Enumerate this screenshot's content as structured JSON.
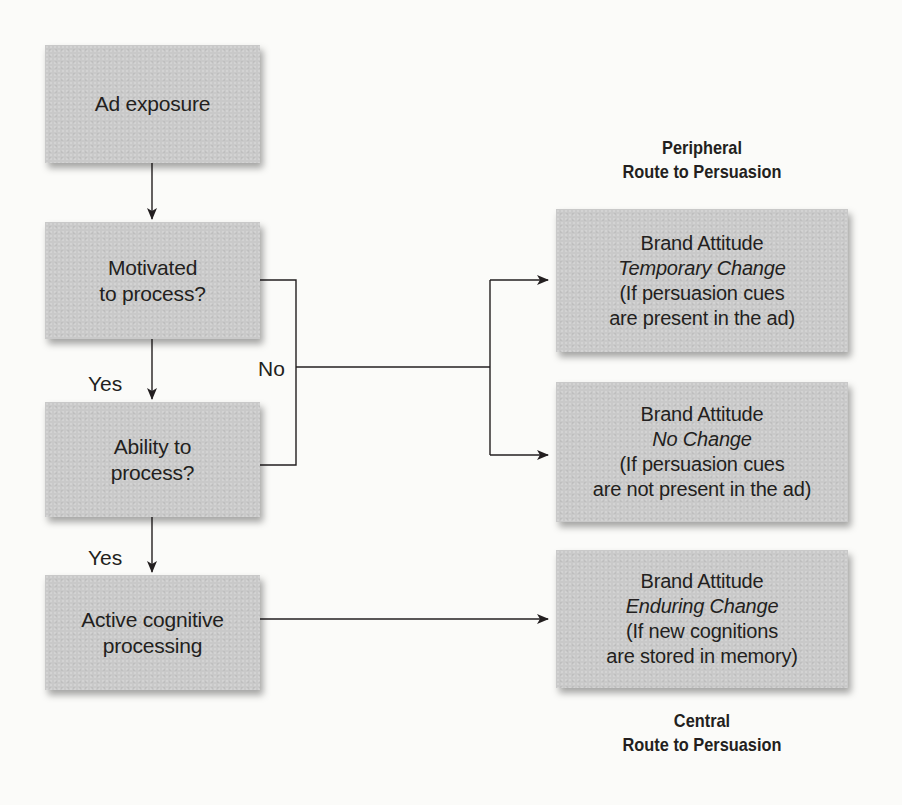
{
  "diagram": {
    "type": "flowchart",
    "colors": {
      "box_fill": "#c9c9c9",
      "line": "#231f20",
      "background": "#fbfbf9",
      "text": "#231f20"
    },
    "left_column": {
      "ad_exposure": {
        "lines": [
          "Ad exposure"
        ]
      },
      "motivated": {
        "lines": [
          "Motivated",
          "to process?"
        ]
      },
      "ability": {
        "lines": [
          "Ability to",
          "process?"
        ]
      },
      "active": {
        "lines": [
          "Active cognitive",
          "processing"
        ]
      }
    },
    "edge_labels": {
      "yes_1": "Yes",
      "yes_2": "Yes",
      "no": "No"
    },
    "right_column": {
      "peripheral_title": [
        "Peripheral",
        "Route to Persuasion"
      ],
      "temporary": {
        "heading": "Brand Attitude",
        "change": "Temporary Change",
        "condition": [
          "(If persuasion cues",
          "are present in the ad)"
        ]
      },
      "no_change": {
        "heading": "Brand Attitude",
        "change": "No Change",
        "condition": [
          "(If persuasion cues",
          "are not present in the ad)"
        ]
      },
      "enduring": {
        "heading": "Brand Attitude",
        "change": "Enduring Change",
        "condition": [
          "(If new cognitions",
          "are stored in memory)"
        ]
      },
      "central_title": [
        "Central",
        "Route to Persuasion"
      ]
    },
    "edges": [
      {
        "from": "Ad exposure",
        "to": "Motivated to process?",
        "label": ""
      },
      {
        "from": "Motivated to process?",
        "to": "Ability to process?",
        "label": "Yes"
      },
      {
        "from": "Ability to process?",
        "to": "Active cognitive processing",
        "label": "Yes"
      },
      {
        "from": "Motivated to process?",
        "to": "Brand Attitude Temporary Change",
        "label": "No"
      },
      {
        "from": "Motivated to process?",
        "to": "Brand Attitude No Change",
        "label": "No"
      },
      {
        "from": "Ability to process?",
        "to": "Brand Attitude Temporary Change",
        "label": "No"
      },
      {
        "from": "Ability to process?",
        "to": "Brand Attitude No Change",
        "label": "No"
      },
      {
        "from": "Active cognitive processing",
        "to": "Brand Attitude Enduring Change",
        "label": ""
      }
    ]
  }
}
